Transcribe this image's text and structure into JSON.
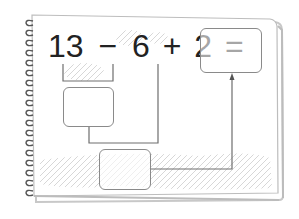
{
  "worksheet": {
    "equation": {
      "terms": [
        "13",
        "−",
        "6",
        "+",
        "2",
        "="
      ],
      "full_text": "13 − 6 + 2 ="
    },
    "answer_box": {
      "value": ""
    },
    "intermediate_box_1": {
      "value": ""
    },
    "intermediate_box_2": {
      "value": ""
    }
  },
  "colors": {
    "ink": "#222222",
    "line": "#6e6e6e",
    "box_border": "#8a8a8a",
    "page_border": "#b5b5b5",
    "spiral": "#555555",
    "shading": "#d9d9d9"
  }
}
